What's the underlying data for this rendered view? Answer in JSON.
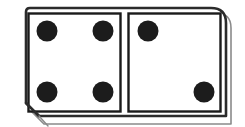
{
  "image": {
    "subject": "domino-tile",
    "title": "Domino tile showing four pips and two pips",
    "width": 245,
    "height": 127,
    "background_color": "#ffffff",
    "style": "black and white line drawing"
  },
  "colors": {
    "ink": "#1a1a1a",
    "outline": "#2b2b2b",
    "shadow_line": "#8a8a8a",
    "face": "#ffffff",
    "pip": "#1c1c1c"
  },
  "tile": {
    "name": "domino",
    "outer_frame": {
      "label": "tile outline",
      "corner_style": "beveled-bottom-left-rounded-top-right",
      "x": 22,
      "y": 8,
      "width": 204,
      "height": 108
    },
    "halves": [
      {
        "id": "left-half",
        "label": "Left half",
        "pip_count": 4,
        "pattern": "four-corners",
        "panel": {
          "x": 28,
          "y": 13,
          "width": 92,
          "height": 98
        },
        "pips": [
          {
            "id": "pip-left-top-left",
            "cx": 47,
            "cy": 31,
            "r": 10
          },
          {
            "id": "pip-left-top-right",
            "cx": 103,
            "cy": 31,
            "r": 10
          },
          {
            "id": "pip-left-bottom-left",
            "cx": 47,
            "cy": 92,
            "r": 10
          },
          {
            "id": "pip-left-bottom-right",
            "cx": 103,
            "cy": 92,
            "r": 10
          }
        ]
      },
      {
        "id": "right-half",
        "label": "Right half",
        "pip_count": 2,
        "pattern": "diagonal",
        "panel": {
          "x": 128,
          "y": 13,
          "width": 92,
          "height": 98
        },
        "pips": [
          {
            "id": "pip-right-top-left",
            "cx": 148,
            "cy": 31,
            "r": 10
          },
          {
            "id": "pip-right-bottom-right",
            "cx": 204,
            "cy": 92,
            "r": 10
          }
        ]
      }
    ],
    "value_text": "4 | 2",
    "total_pips": 6
  }
}
